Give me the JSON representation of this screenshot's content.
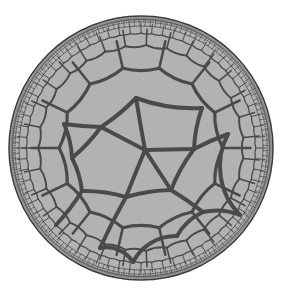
{
  "figure": {
    "type": "hyperbolic-tiling",
    "model": "Poincare disk",
    "disk": {
      "cx": 141,
      "cy": 148,
      "r": 132
    },
    "colors": {
      "background": "#ffffff",
      "fill": "#b2b2b2",
      "edge": "#4a4a4a",
      "rim": "#3a3a3a"
    },
    "central_vertices": [
      [
        136,
        98
      ],
      [
        101,
        127
      ],
      [
        64,
        124
      ],
      [
        202,
        108
      ],
      [
        145,
        150
      ],
      [
        194,
        149
      ],
      [
        72,
        158
      ],
      [
        82,
        191
      ],
      [
        126,
        197
      ],
      [
        171,
        190
      ],
      [
        203,
        212
      ],
      [
        228,
        134
      ],
      [
        100,
        248
      ],
      [
        133,
        262
      ],
      [
        177,
        236
      ],
      [
        240,
        215
      ],
      [
        56,
        225
      ]
    ],
    "central_edges": [
      [
        0,
        1
      ],
      [
        0,
        4
      ],
      [
        0,
        3
      ],
      [
        1,
        2
      ],
      [
        1,
        4
      ],
      [
        1,
        6
      ],
      [
        4,
        5
      ],
      [
        4,
        8
      ],
      [
        4,
        9
      ],
      [
        5,
        3
      ],
      [
        5,
        9
      ],
      [
        5,
        11
      ],
      [
        6,
        7
      ],
      [
        7,
        8
      ],
      [
        8,
        9
      ],
      [
        9,
        10
      ],
      [
        10,
        14
      ],
      [
        8,
        12
      ],
      [
        12,
        13
      ],
      [
        13,
        14
      ],
      [
        10,
        15
      ],
      [
        11,
        15
      ],
      [
        7,
        16
      ],
      [
        6,
        2
      ]
    ]
  }
}
